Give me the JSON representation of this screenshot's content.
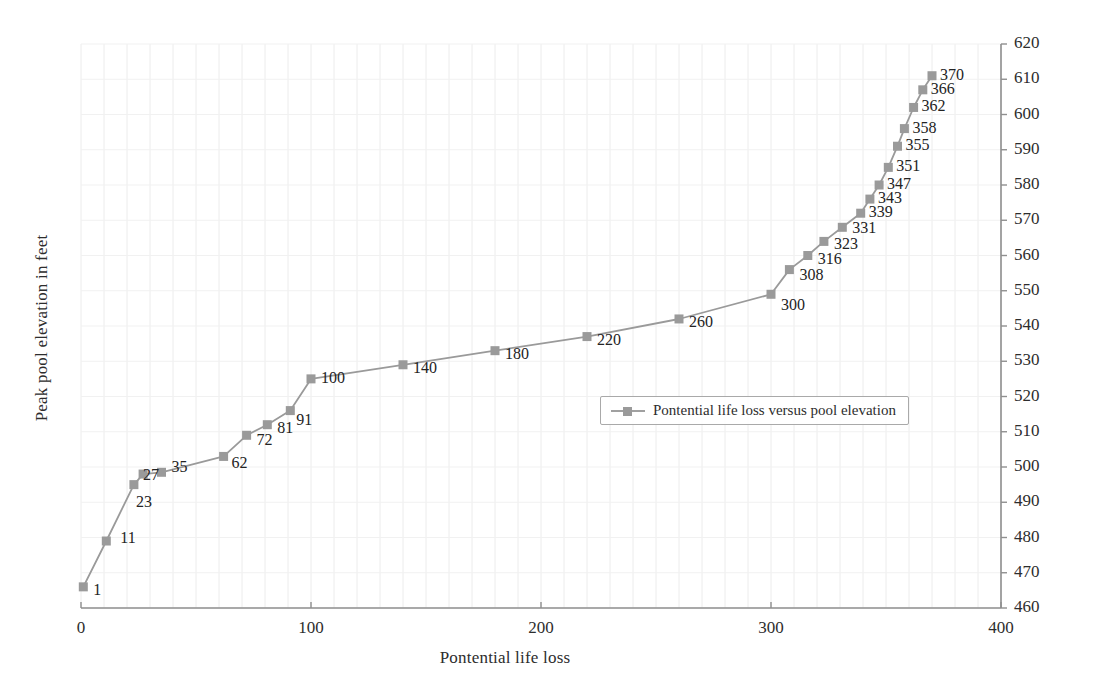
{
  "chart_data": {
    "type": "line",
    "title": "",
    "xlabel": "Pontential life loss",
    "ylabel": "Peak pool elevation in feet",
    "xlim": [
      0,
      400
    ],
    "ylim": [
      460,
      620
    ],
    "xticks": [
      0,
      100,
      200,
      300,
      400
    ],
    "yticks": [
      460,
      470,
      480,
      490,
      500,
      510,
      520,
      530,
      540,
      550,
      560,
      570,
      580,
      590,
      600,
      610,
      620
    ],
    "y_axis_position": "right",
    "grid": true,
    "legend_position": "center-right-inside",
    "series": [
      {
        "name": "Pontential life loss versus pool elevation",
        "color": "#9a9a9a",
        "marker": "square",
        "x": [
          1,
          11,
          23,
          27,
          35,
          62,
          72,
          81,
          91,
          100,
          140,
          180,
          220,
          260,
          300,
          308,
          316,
          323,
          331,
          339,
          343,
          347,
          351,
          355,
          358,
          362,
          366,
          370
        ],
        "y": [
          466,
          479,
          495,
          498,
          498.5,
          503,
          509,
          512,
          516,
          525,
          529,
          533,
          537,
          542,
          549,
          556,
          560,
          564,
          568,
          572,
          576,
          580,
          585,
          591,
          596,
          602,
          607,
          611
        ],
        "point_labels": [
          "1",
          "11",
          "23",
          "27",
          "35",
          "62",
          "72",
          "81",
          "91",
          "100",
          "140",
          "180",
          "220",
          "260",
          "300",
          "308",
          "316",
          "323",
          "331",
          "339",
          "343",
          "347",
          "351",
          "355",
          "358",
          "362",
          "366",
          "370"
        ]
      }
    ]
  },
  "legend": {
    "entries": [
      {
        "label": "Pontential life loss versus pool elevation"
      }
    ]
  }
}
